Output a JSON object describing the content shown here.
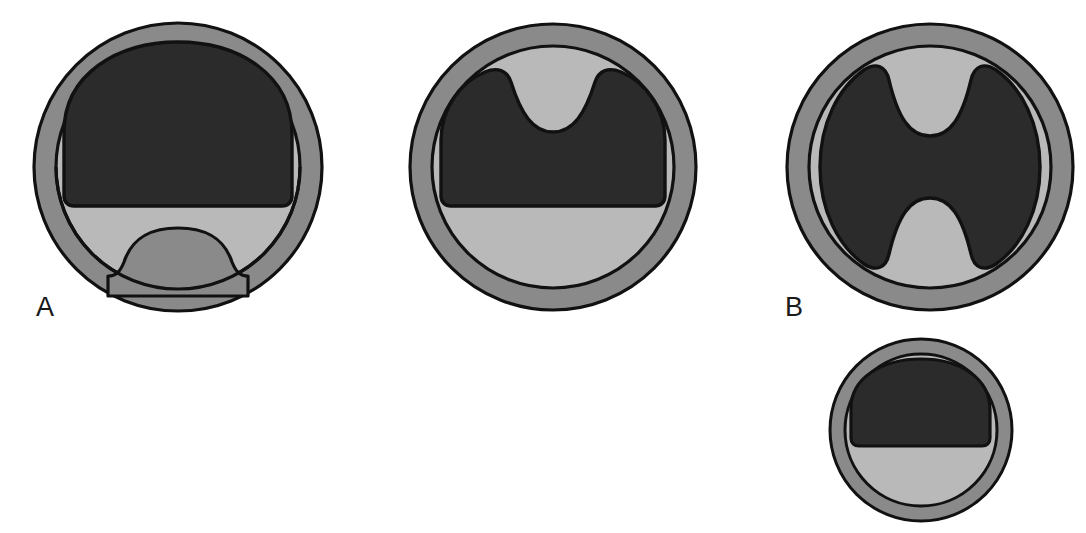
{
  "figure": {
    "type": "anatomical-cross-section-series",
    "background": "#ffffff",
    "width": 1086,
    "height": 533
  },
  "palette": {
    "outer_ring": "#8a8a8a",
    "inner_disc": "#b9b9b9",
    "dark_core": "#2b2b2b",
    "outline": "#111111",
    "background": "#ffffff",
    "label_color": "#1a1a1a"
  },
  "labels": {
    "a": "A",
    "b": "B",
    "c": "C"
  },
  "panels": [
    {
      "id": "a",
      "label": "A",
      "center_x": 178,
      "center_y": 167,
      "outer_radius": 144,
      "inner_radius": 122,
      "core_shape": "dome-with-bottom-bump",
      "notes": "Dark dome occupies the upper portion with a flat horizontal lower border; a rounded bump rises into the light-gray zone from the bottom rim."
    },
    {
      "id": "b",
      "label": "B",
      "center_x": 553,
      "center_y": 167,
      "outer_radius": 143,
      "inner_radius": 121,
      "core_shape": "dome-with-top-notch",
      "notes": "Dark region forms a broad saddle: two raised shoulders with a deep rounded notch dipping down at the top centre; flat horizontal lower border."
    },
    {
      "id": "c",
      "label": "C",
      "center_x": 930,
      "center_y": 167,
      "outer_radius": 143,
      "inner_radius": 121,
      "core_shape": "hourglass-bowtie",
      "notes": "Dark region spans the full height of the inner disc with symmetric rounded notches indenting from both the top centre and the bottom centre, producing a bowtie silhouette."
    },
    {
      "id": "d",
      "label": "",
      "center_x": 921,
      "center_y": 430,
      "outer_radius": 91,
      "inner_radius": 76,
      "core_shape": "plain-dome",
      "notes": "Smaller circle beneath panel C: simple dark dome over the upper half with a flat horizontal lower border and no bump or notch."
    }
  ],
  "legend_terms": {
    "outer_ring_name": "outer rim",
    "inner_disc_name": "intermediate zone",
    "dark_core_name": "central region"
  }
}
